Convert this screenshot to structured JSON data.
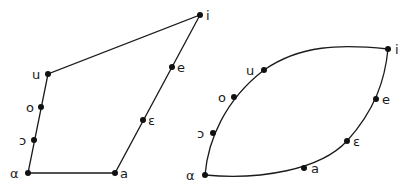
{
  "diagrams": [
    {
      "name": "vowel-quadrilateral-angular",
      "shape": "polygon",
      "points": [
        {
          "label": "i",
          "x": 200,
          "y": 15,
          "lx": 206,
          "ly": 20
        },
        {
          "label": "e",
          "x": 172,
          "y": 67,
          "lx": 177,
          "ly": 72
        },
        {
          "label": "ε",
          "x": 143,
          "y": 120,
          "lx": 148,
          "ly": 125
        },
        {
          "label": "a",
          "x": 115,
          "y": 173,
          "lx": 120,
          "ly": 178
        },
        {
          "label": "α",
          "x": 28,
          "y": 173,
          "lx": 10,
          "ly": 178
        },
        {
          "label": "ɔ",
          "x": 34,
          "y": 140,
          "lx": 19,
          "ly": 145
        },
        {
          "label": "o",
          "x": 41,
          "y": 107,
          "lx": 26,
          "ly": 112
        },
        {
          "label": "u",
          "x": 48,
          "y": 74,
          "lx": 32,
          "ly": 79
        }
      ]
    },
    {
      "name": "vowel-ellipse-curved",
      "shape": "curve",
      "points": [
        {
          "label": "i",
          "x": 388,
          "y": 49,
          "lx": 395,
          "ly": 54
        },
        {
          "label": "e",
          "x": 376,
          "y": 99,
          "lx": 382,
          "ly": 104
        },
        {
          "label": "ε",
          "x": 347,
          "y": 141,
          "lx": 353,
          "ly": 146
        },
        {
          "label": "a",
          "x": 304,
          "y": 168,
          "lx": 311,
          "ly": 173
        },
        {
          "label": "α",
          "x": 205,
          "y": 175,
          "lx": 186,
          "ly": 180
        },
        {
          "label": "ɔ",
          "x": 213,
          "y": 133,
          "lx": 197,
          "ly": 138
        },
        {
          "label": "o",
          "x": 234,
          "y": 97,
          "lx": 218,
          "ly": 102
        },
        {
          "label": "u",
          "x": 264,
          "y": 70,
          "lx": 246,
          "ly": 75
        }
      ]
    }
  ]
}
